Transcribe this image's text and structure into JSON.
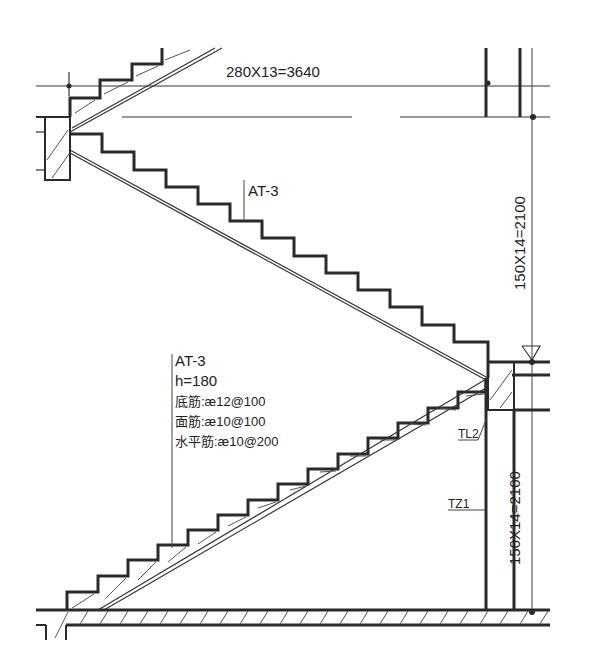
{
  "drawing": {
    "type": "staircase-section",
    "top_dimension": "280X13=3640",
    "upper_vertical_dimension": "150X14=2100",
    "lower_vertical_dimension": "150X14=2100",
    "upper_flight_label": "AT-3",
    "lower_flight_notes": {
      "label": "AT-3",
      "thickness": "h=180",
      "bottom_rebar": "底筋:æ12@100",
      "top_rebar": "面筋:æ10@100",
      "distribution_rebar": "水平筋:æ10@200"
    },
    "beam_label": "TL2",
    "column_label": "TZ1",
    "line_color": "#2a2a2a",
    "background": "#ffffff"
  }
}
